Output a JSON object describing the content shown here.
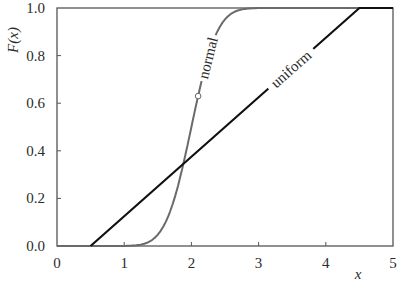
{
  "chart_data": {
    "type": "line",
    "title": "",
    "xlabel": "x",
    "ylabel": "F(x)",
    "xlim": [
      0,
      5
    ],
    "ylim": [
      0.0,
      1.0
    ],
    "grid": false,
    "legend": "inline labels on curves",
    "x_ticks": [
      "0",
      "1",
      "2",
      "3",
      "4",
      "5"
    ],
    "y_ticks": [
      "0.0",
      "0.2",
      "0.4",
      "0.6",
      "0.8",
      "1.0"
    ],
    "series": [
      {
        "name": "normal",
        "label": "normal",
        "color": "#6a6a6a",
        "distribution": "normal CDF, mean 2.0, sd 0.3",
        "mean": 2.0,
        "sd": 0.3,
        "x": [
          0,
          1.0,
          1.2,
          1.4,
          1.6,
          1.8,
          1.9,
          2.0,
          2.1,
          2.2,
          2.4,
          2.6,
          2.8,
          3.0,
          5.0
        ],
        "y": [
          0.0,
          0.0004,
          0.004,
          0.023,
          0.091,
          0.252,
          0.369,
          0.5,
          0.631,
          0.748,
          0.909,
          0.977,
          0.996,
          1.0,
          1.0
        ]
      },
      {
        "name": "uniform",
        "label": "uniform",
        "color": "#111111",
        "distribution": "uniform CDF on [0.5, 4.5]",
        "x": [
          0.5,
          4.5,
          5.0
        ],
        "y": [
          0.0,
          1.0,
          1.0
        ]
      }
    ],
    "annotations": [
      {
        "type": "marker",
        "shape": "open-circle",
        "x": 2.1,
        "y": 0.63,
        "on_series": "normal"
      },
      {
        "type": "intersection",
        "x": 1.89,
        "y": 0.35
      }
    ]
  },
  "labels": {
    "ylabel": "F(x)",
    "xlabel": "x",
    "normal": "normal",
    "uniform": "uniform"
  }
}
